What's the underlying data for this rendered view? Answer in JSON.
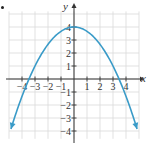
{
  "chart_data": {
    "type": "line",
    "title": "",
    "xlabel": "x",
    "ylabel": "y",
    "xlim": [
      -5,
      5
    ],
    "ylim": [
      -5,
      5
    ],
    "grid": true,
    "x_ticks": [
      -4,
      -3,
      -2,
      -1,
      1,
      2,
      3,
      4
    ],
    "y_ticks": [
      -4,
      -3,
      -2,
      -1,
      1,
      2,
      3,
      4
    ],
    "x_tick_labels": [
      "−4",
      "−3",
      "−2",
      "−1",
      "1",
      "2",
      "3",
      "4"
    ],
    "y_tick_labels": [
      "−4",
      "−3",
      "−2",
      "−1",
      "1",
      "2",
      "3",
      "4"
    ],
    "series": [
      {
        "name": "parabola",
        "equation": "y = 4 - x^2/3",
        "color": "#3a9bc8",
        "arrows": "both-ends",
        "x": [
          -4.9,
          -4,
          -3.46,
          -3,
          -2,
          -1,
          0,
          1,
          2,
          3,
          3.46,
          4,
          4.9
        ],
        "y": [
          -4.0,
          -1.33,
          0,
          1,
          2.67,
          3.67,
          4,
          3.67,
          2.67,
          1,
          0,
          -1.33,
          -4.0
        ]
      }
    ],
    "legend": null
  },
  "axes": {
    "x_label": "x",
    "y_label": "y"
  },
  "colors": {
    "curve": "#3a9bc8",
    "grid": "#d9d9d9",
    "axis": "#333333"
  }
}
